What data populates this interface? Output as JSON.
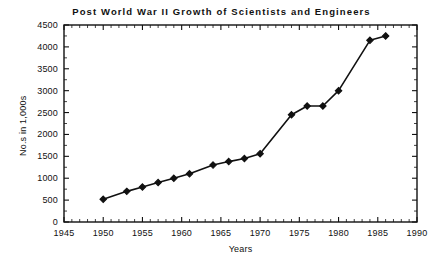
{
  "chart_data": {
    "type": "line",
    "title": "Post World War II Growth of Scientists and Engineers",
    "xlabel": "Years",
    "ylabel": "No.s in 1,000s",
    "xlim": [
      1945,
      1990
    ],
    "ylim": [
      0,
      4500
    ],
    "xticks": [
      1945,
      1950,
      1955,
      1960,
      1965,
      1970,
      1975,
      1980,
      1985,
      1990
    ],
    "yticks": [
      0,
      500,
      1000,
      1500,
      2000,
      2500,
      3000,
      3500,
      4000,
      4500
    ],
    "xtick_labels": [
      "1945",
      "1950",
      "1955",
      "1960",
      "1965",
      "1970",
      "1975",
      "1980",
      "1985",
      "1990"
    ],
    "ytick_labels": [
      "0",
      "500",
      "1000",
      "1500",
      "2000",
      "2500",
      "3000",
      "3500",
      "4000",
      "4500"
    ],
    "grid": false,
    "legend": null,
    "minor_ticks": true,
    "series": [
      {
        "name": "Scientists and Engineers",
        "marker": "diamond",
        "color": "#111111",
        "x": [
          1950,
          1953,
          1955,
          1957,
          1959,
          1961,
          1964,
          1966,
          1968,
          1970,
          1974,
          1976,
          1978,
          1980,
          1984,
          1986
        ],
        "values": [
          520,
          700,
          800,
          900,
          1000,
          1100,
          1300,
          1380,
          1450,
          1560,
          2450,
          2650,
          2650,
          3000,
          4150,
          4250
        ]
      }
    ]
  }
}
